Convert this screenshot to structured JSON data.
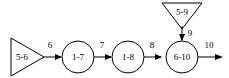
{
  "diagram": {
    "type": "flow-diagram",
    "background_color": "#ffffff",
    "stroke_color": "#000000",
    "nodes": [
      {
        "id": "source-left",
        "shape": "triangle-right",
        "label": "5-6"
      },
      {
        "id": "node-1-7",
        "shape": "circle",
        "label": "1-7"
      },
      {
        "id": "node-1-8",
        "shape": "circle",
        "label": "1-8"
      },
      {
        "id": "node-6-10",
        "shape": "circle",
        "label": "6-10"
      },
      {
        "id": "source-top",
        "shape": "triangle-down",
        "label": "5-9"
      }
    ],
    "edges": [
      {
        "id": "edge-6",
        "label": "6",
        "from": "source-left",
        "to": "node-1-7",
        "direction": "right"
      },
      {
        "id": "edge-7",
        "label": "7",
        "from": "node-1-7",
        "to": "node-1-8",
        "direction": "right"
      },
      {
        "id": "edge-8",
        "label": "8",
        "from": "node-1-8",
        "to": "node-6-10",
        "direction": "right"
      },
      {
        "id": "edge-9",
        "label": "9",
        "from": "source-top",
        "to": "node-6-10",
        "direction": "down"
      },
      {
        "id": "edge-10",
        "label": "10",
        "from": "node-6-10",
        "to": "output",
        "direction": "right"
      }
    ]
  }
}
